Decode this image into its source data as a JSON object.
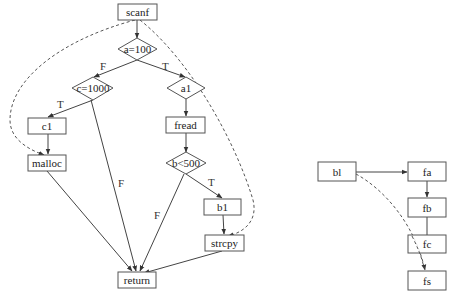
{
  "left_graph": {
    "nodes": {
      "scanf": "scanf",
      "a100": "a=100",
      "c1000": "c=1000",
      "a1": "a1",
      "c1": "c1",
      "fread": "fread",
      "malloc": "malloc",
      "b500": "b<500",
      "b1": "b1",
      "strcpy": "strcpy",
      "return": "return"
    },
    "edge_labels": {
      "a100_c1000": "F",
      "a100_a1": "T",
      "c1000_c1": "T",
      "c1000_return": "F",
      "b500_b1": "T",
      "b500_return": "F"
    }
  },
  "right_graph": {
    "nodes": {
      "bl": "bl",
      "fa": "fa",
      "fb": "fb",
      "fc": "fc",
      "fs": "fs"
    }
  },
  "colors": {
    "stroke": "#555555",
    "text": "#222222",
    "background": "#ffffff"
  }
}
